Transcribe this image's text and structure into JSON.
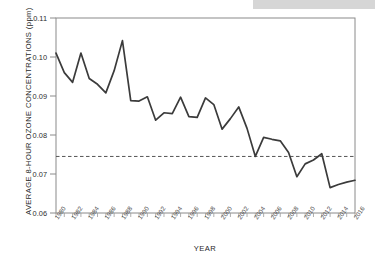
{
  "chart_data": {
    "type": "line",
    "title": "",
    "xlabel": "YEAR",
    "ylabel": "AVERAGE 8-HOUR OZONE CONCENTRATIONS (ppm)",
    "ylim": [
      0.06,
      0.11
    ],
    "xlim": [
      1980,
      2016
    ],
    "grid": false,
    "legend": "none",
    "y_ticks": [
      "0.06",
      "0.07",
      "0.08",
      "0.09",
      "0.10",
      "0.11"
    ],
    "y_tick_values": [
      0.06,
      0.07,
      0.08,
      0.09,
      0.1,
      0.11
    ],
    "x_tick_labels": [
      "1980",
      "1982",
      "1984",
      "1986",
      "1988",
      "1990",
      "1992",
      "1994",
      "1996",
      "1998",
      "2000",
      "2002",
      "2004",
      "2006",
      "2008",
      "2010",
      "2012",
      "2014",
      "2016"
    ],
    "x": [
      1980,
      1981,
      1982,
      1983,
      1984,
      1985,
      1986,
      1987,
      1988,
      1989,
      1990,
      1991,
      1992,
      1993,
      1994,
      1995,
      1996,
      1997,
      1998,
      1999,
      2000,
      2001,
      2002,
      2003,
      2004,
      2005,
      2006,
      2007,
      2008,
      2009,
      2010,
      2011,
      2012,
      2013,
      2014,
      2015,
      2016
    ],
    "values": [
      0.101,
      0.096,
      0.0935,
      0.101,
      0.0945,
      0.093,
      0.0908,
      0.0965,
      0.1042,
      0.0888,
      0.0887,
      0.0898,
      0.0838,
      0.0857,
      0.0855,
      0.0897,
      0.0847,
      0.0845,
      0.0895,
      0.0878,
      0.0815,
      0.0842,
      0.0872,
      0.0817,
      0.0745,
      0.0794,
      0.0789,
      0.0785,
      0.0755,
      0.0693,
      0.0726,
      0.0736,
      0.0752,
      0.0665,
      0.0673,
      0.0679,
      0.0684
    ],
    "series": [
      {
        "name": "Average 8-hour ozone concentration",
        "values": [
          0.101,
          0.096,
          0.0935,
          0.101,
          0.0945,
          0.093,
          0.0908,
          0.0965,
          0.1042,
          0.0888,
          0.0887,
          0.0898,
          0.0838,
          0.0857,
          0.0855,
          0.0897,
          0.0847,
          0.0845,
          0.0895,
          0.0878,
          0.0815,
          0.0842,
          0.0872,
          0.0817,
          0.0745,
          0.0794,
          0.0789,
          0.0785,
          0.0755,
          0.0693,
          0.0726,
          0.0736,
          0.0752,
          0.0665,
          0.0673,
          0.0679,
          0.0684
        ],
        "color": "#3b3b3b"
      }
    ],
    "reference_line": {
      "name": "standard-reference-line",
      "value": 0.0745,
      "style": "dashed",
      "color": "#555555"
    }
  }
}
